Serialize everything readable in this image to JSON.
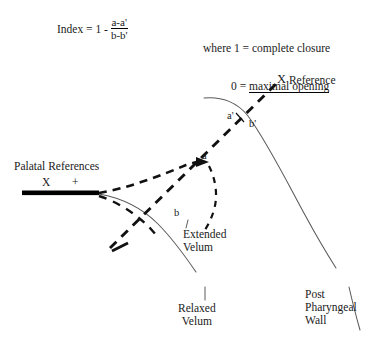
{
  "figure": {
    "formula": {
      "lead": "Index = 1 -",
      "numerator": "a-a'",
      "denominator": "b-b'"
    },
    "legend": {
      "line1_prefix": "where 1 = ",
      "line1_value": "complete closure",
      "line2_prefix": "0 = ",
      "line2_value": "maximal opening"
    },
    "labels": {
      "x_reference_mark": "X",
      "x_reference_text": " Reference",
      "a_prime": "a'",
      "b_prime": "b'",
      "a": "a",
      "b": "b",
      "palatal_references": "Palatal References",
      "palatal_mark_x": "X",
      "palatal_mark_plus": "+",
      "extended_velum": "Extended\nVelum",
      "relaxed_velum": "Relaxed\nVelum",
      "post_pharyngeal_wall": "Post\nPharyngeal\nWall"
    },
    "colors": {
      "ink": "#000000",
      "text": "#1a1a1a",
      "thin_line": "#5a5a5a",
      "background": "#ffffff"
    },
    "geometry": {
      "reference_line": "dashed line from lower-left velum region through point a up to X Reference marker",
      "pharyngeal_wall": "thin curve arcing from upper-left down through a'/b' to lower right",
      "relaxed_velum_curve": "thin curve from palatal bar descending right to lower center",
      "palatal_bar": "thick black horizontal bar under X and + markers"
    }
  }
}
